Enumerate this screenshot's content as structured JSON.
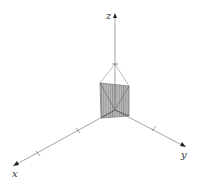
{
  "diagram": {
    "type": "3d-coordinate-axes-with-solid",
    "axes": {
      "x": {
        "label": "x"
      },
      "y": {
        "label": "y"
      },
      "z": {
        "label": "z"
      }
    },
    "solid": {
      "description": "shaded triangular prism / wedge region near origin, apex edges meeting at a point on the z-axis",
      "fill": "#b8b8b8",
      "hatch_color": "#7a7a7a"
    },
    "colors": {
      "axis": "#555555",
      "background": "#ffffff"
    }
  }
}
